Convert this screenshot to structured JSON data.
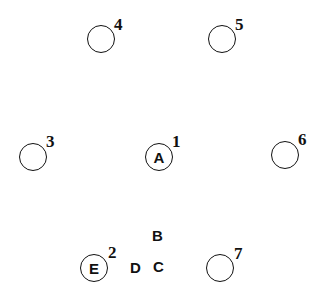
{
  "diagram": {
    "positions": [
      {
        "number": "4",
        "letter": ""
      },
      {
        "number": "5",
        "letter": ""
      },
      {
        "number": "3",
        "letter": ""
      },
      {
        "number": "1",
        "letter": "A"
      },
      {
        "number": "6",
        "letter": ""
      },
      {
        "number": "2",
        "letter": "E"
      },
      {
        "number": "7",
        "letter": ""
      }
    ],
    "free_letters": [
      {
        "label": "B"
      },
      {
        "label": "D"
      },
      {
        "label": "C"
      }
    ]
  }
}
